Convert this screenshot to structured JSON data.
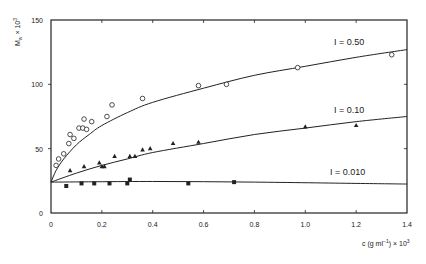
{
  "chart_data": {
    "type": "scatter",
    "title": "",
    "xlabel": "c (g ml⁻¹) × 10³",
    "ylabel": "M_w × 10³",
    "xlim": [
      0,
      1.4
    ],
    "ylim": [
      0,
      150
    ],
    "xticks": [
      0,
      0.2,
      0.4,
      0.6,
      0.8,
      1.0,
      1.2,
      1.4
    ],
    "xtick_labels": [
      "0",
      "0.2",
      "0.4",
      "0.6",
      "0.8",
      "1.0",
      "1.2",
      "1.4"
    ],
    "yticks": [
      0,
      50,
      100,
      150
    ],
    "ytick_labels": [
      "0",
      "50",
      "100",
      "150"
    ],
    "grid": false,
    "legend": "inline labels at right of each curve",
    "series": [
      {
        "name": "I = 0.50",
        "marker": "open-circle",
        "points": [
          [
            0.02,
            37
          ],
          [
            0.03,
            42
          ],
          [
            0.05,
            46
          ],
          [
            0.07,
            54
          ],
          [
            0.075,
            61
          ],
          [
            0.09,
            58
          ],
          [
            0.11,
            66
          ],
          [
            0.125,
            66
          ],
          [
            0.14,
            65
          ],
          [
            0.13,
            73
          ],
          [
            0.16,
            71
          ],
          [
            0.22,
            75
          ],
          [
            0.24,
            84
          ],
          [
            0.36,
            89
          ],
          [
            0.58,
            99
          ],
          [
            0.69,
            100
          ],
          [
            0.97,
            113
          ],
          [
            1.34,
            123
          ]
        ],
        "fit_curve": [
          [
            0,
            24
          ],
          [
            0.02,
            33
          ],
          [
            0.05,
            42
          ],
          [
            0.1,
            53
          ],
          [
            0.15,
            61
          ],
          [
            0.2,
            68
          ],
          [
            0.3,
            78
          ],
          [
            0.4,
            86
          ],
          [
            0.6,
            97
          ],
          [
            0.8,
            107
          ],
          [
            1.0,
            114
          ],
          [
            1.2,
            121
          ],
          [
            1.4,
            127
          ]
        ]
      },
      {
        "name": "I = 0.10",
        "marker": "filled-triangle",
        "points": [
          [
            0.075,
            33
          ],
          [
            0.13,
            36
          ],
          [
            0.19,
            39
          ],
          [
            0.2,
            36
          ],
          [
            0.21,
            36
          ],
          [
            0.25,
            44
          ],
          [
            0.31,
            44
          ],
          [
            0.33,
            44
          ],
          [
            0.36,
            49
          ],
          [
            0.39,
            50
          ],
          [
            0.48,
            54
          ],
          [
            0.58,
            55
          ],
          [
            1.0,
            67
          ],
          [
            1.2,
            68
          ]
        ],
        "fit_curve": [
          [
            0,
            24
          ],
          [
            0.1,
            31
          ],
          [
            0.2,
            37
          ],
          [
            0.3,
            42
          ],
          [
            0.4,
            47
          ],
          [
            0.6,
            54
          ],
          [
            0.8,
            61
          ],
          [
            1.0,
            66
          ],
          [
            1.2,
            71
          ],
          [
            1.4,
            75
          ]
        ]
      },
      {
        "name": "I = 0.010",
        "marker": "filled-square",
        "points": [
          [
            0.06,
            21
          ],
          [
            0.12,
            23
          ],
          [
            0.17,
            23
          ],
          [
            0.23,
            23
          ],
          [
            0.3,
            23
          ],
          [
            0.31,
            26
          ],
          [
            0.54,
            23
          ],
          [
            0.72,
            24
          ]
        ],
        "fit_curve": [
          [
            0,
            24
          ],
          [
            0.4,
            24.5
          ],
          [
            0.8,
            24
          ],
          [
            1.2,
            23
          ],
          [
            1.4,
            22.5
          ]
        ]
      }
    ],
    "annotations": [
      "I = 0.50",
      "I = 0.10",
      "I = 0.010"
    ]
  },
  "labels": {
    "ylabel_main": "M",
    "ylabel_sub": "w",
    "ylabel_rest": " × 10",
    "ylabel_sup": "3",
    "xlabel_main": "c (g ml",
    "xlabel_sup1": "−1",
    "xlabel_rest": ") × 10",
    "xlabel_sup2": "3",
    "curve_050": "I = 0.50",
    "curve_010": "I = 0.10",
    "curve_0010": "I = 0.010"
  },
  "style": {
    "ink": "#222222",
    "background": "#ffffff"
  }
}
